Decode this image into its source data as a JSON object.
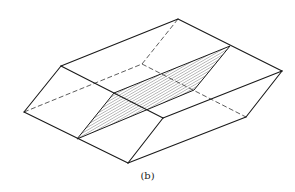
{
  "figure": {
    "caption": "(b)",
    "colors": {
      "line": "#1a1a1a",
      "hatch": "#555555",
      "background": "#ffffff"
    },
    "vertices": {
      "left": [
        24,
        112
      ],
      "upper_left": [
        61,
        66
      ],
      "top_back": [
        178,
        19
      ],
      "right": [
        282,
        71
      ],
      "right_lower": [
        246,
        117
      ],
      "bottom": [
        128,
        163
      ],
      "lower_left": [
        78,
        138
      ],
      "hidden_back": [
        142,
        64
      ],
      "front_top_end": [
        163,
        118
      ],
      "section_top_left": [
        114,
        93
      ],
      "section_top_right": [
        230,
        46
      ],
      "section_bottom_right": [
        194,
        90
      ],
      "section_bottom_left": [
        77,
        139
      ]
    }
  }
}
